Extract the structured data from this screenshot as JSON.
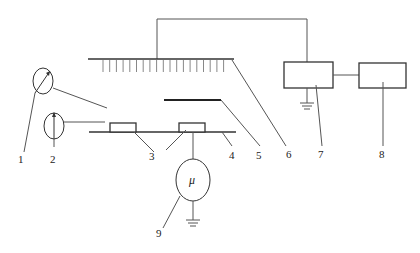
{
  "diagram": {
    "type": "schematic",
    "colors": {
      "line": "#555555",
      "background": "#ffffff"
    },
    "components": [
      {
        "id": "1",
        "label": "1",
        "description": "gauge-dial-circle-with-diagonal-arrow"
      },
      {
        "id": "2",
        "label": "2",
        "description": "gauge-dial-circle-with-vertical-arrow"
      },
      {
        "id": "3",
        "label": "3",
        "description": "two-small-rectangular-samples-on-stage"
      },
      {
        "id": "4",
        "label": "4",
        "description": "horizontal-stage-line"
      },
      {
        "id": "5",
        "label": "5",
        "description": "thick-horizontal-plate"
      },
      {
        "id": "6",
        "label": "6",
        "description": "comb-electrode-with-vertical-teeth"
      },
      {
        "id": "7",
        "label": "7",
        "description": "grounded-rectangular-box"
      },
      {
        "id": "8",
        "label": "8",
        "description": "rectangular-box-connected-to-7"
      },
      {
        "id": "9",
        "label": "9",
        "description": "micro-ammeter-circle-grounded"
      }
    ],
    "meter_symbol": "μ",
    "labels": [
      "1",
      "2",
      "3",
      "4",
      "5",
      "6",
      "7",
      "8",
      "9"
    ]
  }
}
